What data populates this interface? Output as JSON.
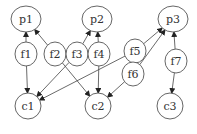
{
  "diagram": {
    "type": "directed-graph",
    "colors": {
      "stroke": "#555555",
      "text": "#333333",
      "background": "#ffffff"
    },
    "nodes": [
      {
        "id": "p1",
        "label": "p1",
        "x": 26,
        "y": 19,
        "rx": 15,
        "ry": 13
      },
      {
        "id": "p2",
        "label": "p2",
        "x": 97,
        "y": 19,
        "rx": 15,
        "ry": 13
      },
      {
        "id": "p3",
        "label": "p3",
        "x": 173,
        "y": 19,
        "rx": 15,
        "ry": 13
      },
      {
        "id": "f1",
        "label": "f1",
        "x": 26,
        "y": 54,
        "rx": 11,
        "ry": 12
      },
      {
        "id": "f2",
        "label": "f2",
        "x": 55,
        "y": 54,
        "rx": 11,
        "ry": 12
      },
      {
        "id": "f3",
        "label": "f3",
        "x": 77,
        "y": 54,
        "rx": 11,
        "ry": 12
      },
      {
        "id": "f4",
        "label": "f4",
        "x": 99,
        "y": 54,
        "rx": 11,
        "ry": 12
      },
      {
        "id": "f5",
        "label": "f5",
        "x": 135,
        "y": 51,
        "rx": 11,
        "ry": 12
      },
      {
        "id": "f6",
        "label": "f6",
        "x": 133,
        "y": 74,
        "rx": 11,
        "ry": 12
      },
      {
        "id": "f7",
        "label": "f7",
        "x": 176,
        "y": 61,
        "rx": 11,
        "ry": 12
      },
      {
        "id": "c1",
        "label": "c1",
        "x": 28,
        "y": 106,
        "rx": 13,
        "ry": 13
      },
      {
        "id": "c2",
        "label": "c2",
        "x": 98,
        "y": 106,
        "rx": 13,
        "ry": 13
      },
      {
        "id": "c3",
        "label": "c3",
        "x": 170,
        "y": 106,
        "rx": 13,
        "ry": 13
      }
    ],
    "edges": [
      {
        "from": "f1",
        "to": "p1"
      },
      {
        "from": "f2",
        "to": "p1"
      },
      {
        "from": "f3",
        "to": "p2"
      },
      {
        "from": "f4",
        "to": "p2"
      },
      {
        "from": "f5",
        "to": "p3"
      },
      {
        "from": "f6",
        "to": "p3"
      },
      {
        "from": "f7",
        "to": "p3"
      },
      {
        "from": "f1",
        "to": "c1"
      },
      {
        "from": "f3",
        "to": "c1"
      },
      {
        "from": "f5",
        "to": "c1"
      },
      {
        "from": "f2",
        "to": "c2"
      },
      {
        "from": "f4",
        "to": "c2"
      },
      {
        "from": "f6",
        "to": "c2"
      },
      {
        "from": "f7",
        "to": "c3"
      }
    ]
  }
}
